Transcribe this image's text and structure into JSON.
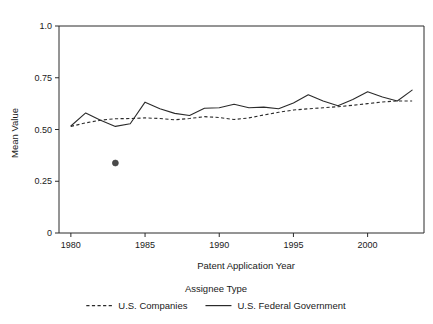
{
  "chart_data": {
    "type": "line",
    "title": "",
    "xlabel": "Patent Application Year",
    "ylabel": "Mean Value",
    "xlim": [
      1979.2,
      2003.8
    ],
    "ylim": [
      0,
      1.0
    ],
    "grid": false,
    "legend_position": "bottom",
    "legend_title": "Assignee Type",
    "x_ticks": [
      1980,
      1985,
      1990,
      1995,
      2000
    ],
    "x_tick_labels": [
      "1980",
      "1985",
      "1990",
      "1995",
      "2000"
    ],
    "y_ticks": [
      0,
      0.25,
      0.5,
      0.75,
      1.0
    ],
    "y_tick_labels": [
      "0",
      "0.25",
      "0.50",
      "0.75",
      "1.0"
    ],
    "x": [
      1980,
      1981,
      1982,
      1983,
      1984,
      1985,
      1986,
      1987,
      1988,
      1989,
      1990,
      1991,
      1992,
      1993,
      1994,
      1995,
      1996,
      1997,
      1998,
      1999,
      2000,
      2001,
      2002,
      2003
    ],
    "series": [
      {
        "name": "U.S. Companies",
        "style": "dashed",
        "values": [
          0.515,
          0.532,
          0.545,
          0.552,
          0.553,
          0.556,
          0.553,
          0.547,
          0.553,
          0.562,
          0.558,
          0.548,
          0.556,
          0.57,
          0.583,
          0.594,
          0.6,
          0.605,
          0.61,
          0.617,
          0.625,
          0.633,
          0.638,
          0.638
        ]
      },
      {
        "name": "U.S. Federal Government",
        "style": "solid",
        "values": [
          0.517,
          0.58,
          0.545,
          0.515,
          0.528,
          0.632,
          0.6,
          0.578,
          0.568,
          0.603,
          0.605,
          0.622,
          0.605,
          0.608,
          0.6,
          0.628,
          0.668,
          0.638,
          0.615,
          0.645,
          0.682,
          0.657,
          0.638,
          0.69
        ]
      }
    ],
    "annotations": [
      {
        "type": "point",
        "name": "outlier-marker",
        "x": 1983,
        "y": 0.338
      }
    ]
  },
  "legend": {
    "title": "Assignee Type",
    "entries": [
      {
        "label": "U.S. Companies",
        "style": "dashed"
      },
      {
        "label": "U.S. Federal Government",
        "style": "solid"
      }
    ]
  },
  "colors": {
    "ink": "#2b2b2b",
    "background": "#ffffff",
    "outlier": "#4a4a4a"
  }
}
